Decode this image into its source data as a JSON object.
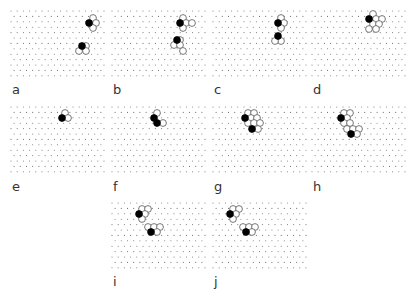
{
  "figure": {
    "grid": {
      "dx": 6.2,
      "dy": 5.4,
      "cols": 16,
      "rows": 13,
      "dot_radius": 0.55,
      "dot_color": "#777777"
    },
    "circle_radius": 3.4,
    "stroke_color": "#555555",
    "fill_black": "#000000",
    "fill_white": "#ffffff",
    "panels": [
      {
        "id": "a",
        "label": "a",
        "x": 10,
        "y": 10,
        "label_x": 12,
        "label_y": 83,
        "black": [
          [
            79,
            13
          ],
          [
            72,
            36
          ]
        ],
        "white": [
          [
            83,
            8
          ],
          [
            86,
            13
          ],
          [
            83,
            18
          ],
          [
            76,
            36
          ],
          [
            69,
            41
          ],
          [
            76,
            41
          ]
        ]
      },
      {
        "id": "b",
        "label": "b",
        "x": 111,
        "y": 10,
        "label_x": 113,
        "label_y": 83,
        "black": [
          [
            69,
            13
          ],
          [
            66,
            30
          ]
        ],
        "white": [
          [
            72,
            8
          ],
          [
            75,
            13
          ],
          [
            81,
            13
          ],
          [
            72,
            18
          ],
          [
            69,
            30
          ],
          [
            63,
            35
          ],
          [
            69,
            35
          ],
          [
            72,
            41
          ]
        ]
      },
      {
        "id": "c",
        "label": "c",
        "x": 212,
        "y": 10,
        "label_x": 214,
        "label_y": 83,
        "black": [
          [
            66,
            13
          ],
          [
            66,
            26
          ]
        ],
        "white": [
          [
            69,
            8
          ],
          [
            72,
            13
          ],
          [
            69,
            18
          ],
          [
            69,
            31
          ],
          [
            63,
            31
          ]
        ]
      },
      {
        "id": "d",
        "label": "d",
        "x": 311,
        "y": 10,
        "label_x": 313,
        "label_y": 83,
        "black": [
          [
            58,
            9
          ]
        ],
        "white": [
          [
            62,
            4
          ],
          [
            65,
            9
          ],
          [
            71,
            9
          ],
          [
            62,
            14
          ],
          [
            68,
            14
          ],
          [
            58,
            19
          ],
          [
            65,
            19
          ]
        ]
      },
      {
        "id": "e",
        "label": "e",
        "x": 10,
        "y": 106,
        "label_x": 12,
        "label_y": 180,
        "black": [
          [
            52,
            12
          ]
        ],
        "white": [
          [
            55,
            7
          ],
          [
            58,
            12
          ]
        ]
      },
      {
        "id": "f",
        "label": "f",
        "x": 111,
        "y": 106,
        "label_x": 113,
        "label_y": 180,
        "black": [
          [
            43,
            12
          ],
          [
            46,
            17
          ]
        ],
        "white": [
          [
            46,
            7
          ],
          [
            52,
            17
          ]
        ]
      },
      {
        "id": "g",
        "label": "g",
        "x": 212,
        "y": 106,
        "label_x": 214,
        "label_y": 180,
        "black": [
          [
            33,
            12
          ],
          [
            40,
            23
          ]
        ],
        "white": [
          [
            36,
            7
          ],
          [
            42,
            7
          ],
          [
            39,
            12
          ],
          [
            45,
            12
          ],
          [
            36,
            17
          ],
          [
            42,
            17
          ],
          [
            48,
            17
          ],
          [
            46,
            23
          ]
        ]
      },
      {
        "id": "h",
        "label": "h",
        "x": 311,
        "y": 106,
        "label_x": 313,
        "label_y": 180,
        "black": [
          [
            30,
            12
          ],
          [
            40,
            28
          ]
        ],
        "white": [
          [
            33,
            7
          ],
          [
            39,
            7
          ],
          [
            36,
            12
          ],
          [
            33,
            17
          ],
          [
            39,
            17
          ],
          [
            36,
            23
          ],
          [
            42,
            23
          ],
          [
            48,
            23
          ],
          [
            46,
            28
          ]
        ]
      },
      {
        "id": "i",
        "label": "i",
        "x": 111,
        "y": 202,
        "label_x": 113,
        "label_y": 275,
        "black": [
          [
            28,
            12
          ],
          [
            40,
            30
          ]
        ],
        "white": [
          [
            31,
            7
          ],
          [
            37,
            7
          ],
          [
            34,
            12
          ],
          [
            31,
            17
          ],
          [
            37,
            25
          ],
          [
            43,
            25
          ],
          [
            49,
            25
          ],
          [
            46,
            30
          ]
        ]
      },
      {
        "id": "j",
        "label": "j",
        "x": 212,
        "y": 202,
        "label_x": 214,
        "label_y": 275,
        "black": [
          [
            18,
            12
          ],
          [
            34,
            30
          ]
        ],
        "white": [
          [
            21,
            7
          ],
          [
            27,
            7
          ],
          [
            24,
            12
          ],
          [
            21,
            17
          ],
          [
            31,
            25
          ],
          [
            37,
            25
          ],
          [
            43,
            25
          ],
          [
            40,
            30
          ]
        ]
      }
    ]
  }
}
